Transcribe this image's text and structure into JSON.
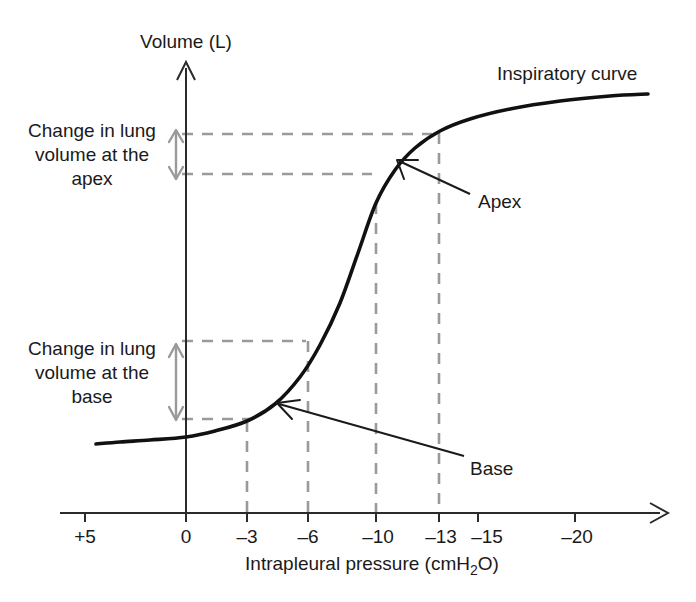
{
  "figure": {
    "kind": "lung-compliance-curve",
    "background_color": "#ffffff",
    "curve_color": "#111111",
    "guide_color": "#9a9a9a",
    "axis_color": "#2b2b2b"
  },
  "axes": {
    "y_title": "Volume (L)",
    "x_title_parts": {
      "before": "Intrapleural pressure (cmH",
      "sub": "2",
      "after": "O)"
    },
    "x_title_full": "Intrapleural pressure (cmH2O)"
  },
  "annotations": {
    "curve_label": "Inspiratory curve",
    "apex_label": "Apex",
    "base_label": "Base",
    "apex_change": {
      "line1": "Change in lung",
      "line2": "volume at the",
      "line3": "apex"
    },
    "base_change": {
      "line1": "Change in lung",
      "line2": "volume at the",
      "line3": "base"
    }
  },
  "chart_data": {
    "type": "line",
    "title": "",
    "xlabel": "Intrapleural pressure (cmH2O)",
    "ylabel": "Volume (L)",
    "xlim": [
      5,
      -22
    ],
    "ylim": [
      0,
      1
    ],
    "grid": false,
    "legend": "none",
    "x_ticks": [
      {
        "label": "+5",
        "value": 5,
        "px": 85
      },
      {
        "label": "0",
        "value": 0,
        "px": 186
      },
      {
        "label": "–3",
        "value": -3,
        "px": 247
      },
      {
        "label": "–6",
        "value": -6,
        "px": 308
      },
      {
        "label": "–10",
        "value": -10,
        "px": 376
      },
      {
        "label": "–13",
        "value": -13,
        "px": 439
      },
      {
        "label": "–15",
        "value": -15,
        "px": 478
      },
      {
        "label": "–20",
        "value": -20,
        "px": 575
      }
    ],
    "y_ticks": [],
    "series": [
      {
        "name": "Inspiratory curve",
        "points_px": [
          [
            96,
            444
          ],
          [
            120,
            442
          ],
          [
            150,
            440
          ],
          [
            186,
            437
          ],
          [
            215,
            431
          ],
          [
            247,
            421
          ],
          [
            275,
            404
          ],
          [
            300,
            377
          ],
          [
            320,
            345
          ],
          [
            340,
            303
          ],
          [
            358,
            253
          ],
          [
            376,
            203
          ],
          [
            395,
            170
          ],
          [
            415,
            148
          ],
          [
            440,
            131
          ],
          [
            470,
            119
          ],
          [
            510,
            109
          ],
          [
            560,
            101
          ],
          [
            610,
            96
          ],
          [
            648,
            94
          ]
        ]
      }
    ],
    "marked_points": [
      {
        "name": "base",
        "x": -3,
        "px": [
          247,
          421
        ]
      },
      {
        "name": "base_upper",
        "x": -6,
        "px": [
          308,
          341
        ]
      },
      {
        "name": "apex",
        "x": -10,
        "px": [
          376,
          203
        ]
      },
      {
        "name": "apex_upper",
        "x": -13,
        "px": [
          439,
          133
        ]
      }
    ],
    "guides": {
      "vertical_px": [
        {
          "x": 247,
          "y_top": 421,
          "y_bottom": 513
        },
        {
          "x": 308,
          "y_top": 341,
          "y_bottom": 513
        },
        {
          "x": 376,
          "y_top": 203,
          "y_bottom": 513
        },
        {
          "x": 439,
          "y_top": 133,
          "y_bottom": 513
        }
      ],
      "horizontal_px": [
        {
          "y": 134,
          "x_left": 182,
          "x_right": 432
        },
        {
          "y": 174,
          "x_left": 182,
          "x_right": 372
        },
        {
          "y": 341,
          "x_left": 182,
          "x_right": 306
        },
        {
          "y": 419,
          "x_left": 182,
          "x_right": 250
        }
      ]
    },
    "span_arrows_px": [
      {
        "name": "apex-change",
        "x": 176,
        "y_top": 131,
        "y_bottom": 178
      },
      {
        "name": "base-change",
        "x": 176,
        "y_top": 345,
        "y_bottom": 419
      }
    ],
    "pointers_px": [
      {
        "name": "apex-pointer",
        "from": [
          470,
          194
        ],
        "to": [
          397,
          160
        ]
      },
      {
        "name": "base-pointer",
        "from": [
          464,
          456
        ],
        "to": [
          277,
          404
        ]
      }
    ],
    "geometry_px": {
      "y_axis_x": 186,
      "y_axis_top": 62,
      "x_axis_y": 513,
      "x_axis_left": 60,
      "x_axis_right": 668,
      "tick_bottom": 522
    }
  }
}
